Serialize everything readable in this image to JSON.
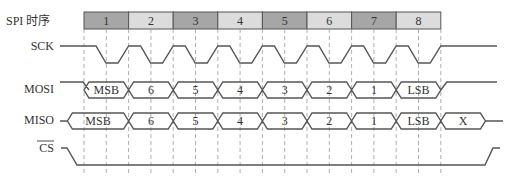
{
  "title": "SPI 时序",
  "signals": {
    "sck": "SCK",
    "mosi": "MOSI",
    "miso": "MISO",
    "cs": "CS"
  },
  "clock_cells": [
    {
      "label": "1",
      "color": "#a6a6a6"
    },
    {
      "label": "2",
      "color": "#dcdcdc"
    },
    {
      "label": "3",
      "color": "#a6a6a6"
    },
    {
      "label": "4",
      "color": "#dcdcdc"
    },
    {
      "label": "5",
      "color": "#a6a6a6"
    },
    {
      "label": "6",
      "color": "#dcdcdc"
    },
    {
      "label": "7",
      "color": "#a6a6a6"
    },
    {
      "label": "8",
      "color": "#dcdcdc"
    }
  ],
  "mosi_bits": [
    "MSB",
    "6",
    "5",
    "4",
    "3",
    "2",
    "1",
    "LSB"
  ],
  "miso_bits": [
    "MSB",
    "6",
    "5",
    "4",
    "3",
    "2",
    "1",
    "LSB",
    "X"
  ],
  "colors": {
    "wave": "#555555",
    "grid": "#9a9a9a",
    "cell_dark": "#a6a6a6",
    "cell_light": "#dcdcdc"
  }
}
